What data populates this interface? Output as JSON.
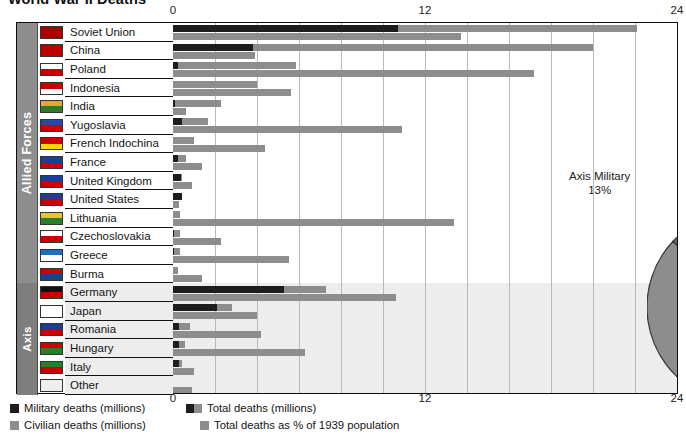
{
  "title": "World War II Deaths",
  "axis": {
    "ticks": [
      "0",
      "12",
      "24"
    ],
    "max": 24
  },
  "groups": [
    {
      "label": "Allied Forces",
      "start": 0,
      "count": 14
    },
    {
      "label": "Axis",
      "start": 14,
      "count": 6
    }
  ],
  "legend": [
    {
      "name": "military-deaths",
      "label": "Military deaths (millions)",
      "swatch": "dark"
    },
    {
      "name": "civilian-deaths",
      "label": "Civilian deaths (millions)",
      "swatch": "grey"
    },
    {
      "name": "total-deaths",
      "label": "Total deaths (millions)",
      "swatch": "split"
    },
    {
      "name": "total-deaths-pct",
      "label": "Total deaths  as % of 1939 population",
      "swatch": "grey"
    }
  ],
  "colors": {
    "military": "#1d1d1d",
    "civilian": "#8d8d8d",
    "percent": "#8d8d8d",
    "rail": "#8e8e8e",
    "axis_band": "#ededed",
    "frame": "#0e0e0e",
    "pie_allied_civilians": "#8d8d8d",
    "pie_allied_military": "#c9c9c9",
    "pie_axis_military": "#6a6a6a",
    "pie_axis_civilians": "#c4c4c4"
  },
  "chart_data": {
    "type": "bar",
    "title": "World War II Deaths",
    "xlabel": "",
    "ylabel": "",
    "xlim": [
      0,
      24
    ],
    "ticks": [
      0,
      12,
      24
    ],
    "grid": true,
    "note": "Each country row shows a stacked total-deaths bar (military in dark + civilian in grey) and a second grey bar for total deaths as % of 1939 population, both on the same 0-24 scale.",
    "series": [
      {
        "name": "Military deaths (millions)",
        "color": "#1d1d1d"
      },
      {
        "name": "Civilian deaths (millions)",
        "color": "#8d8d8d"
      },
      {
        "name": "Total deaths as % of 1939 population",
        "color": "#8d8d8d"
      }
    ],
    "categories": [
      "Soviet Union",
      "China",
      "Poland",
      "Indonesia",
      "India",
      "Yugoslavia",
      "French Indochina",
      "France",
      "United Kingdom",
      "United States",
      "Lithuania",
      "Czechoslovakia",
      "Greece",
      "Burma",
      "Latvia",
      "Germany",
      "Japan",
      "Romania",
      "Hungary",
      "Italy",
      "Other"
    ],
    "rows": [
      {
        "country": "Soviet Union",
        "side": "Allied",
        "military": 10.7,
        "civilian": 11.4,
        "total": 22.1,
        "pct": 13.7,
        "flag": "ussr"
      },
      {
        "country": "China",
        "side": "Allied",
        "military": 3.8,
        "civilian": 16.2,
        "total": 20.0,
        "pct": 3.9,
        "flag": "china"
      },
      {
        "country": "Poland",
        "side": "Allied",
        "military": 0.24,
        "civilian": 5.6,
        "total": 5.8,
        "pct": 17.2,
        "flag": "poland"
      },
      {
        "country": "Indonesia",
        "side": "Allied",
        "military": 0.0,
        "civilian": 4.0,
        "total": 4.0,
        "pct": 5.6,
        "flag": "indonesia"
      },
      {
        "country": "India",
        "side": "Allied",
        "military": 0.09,
        "civilian": 2.2,
        "total": 2.2,
        "pct": 0.6,
        "flag": "india"
      },
      {
        "country": "Yugoslavia",
        "side": "Allied",
        "military": 0.45,
        "civilian": 1.2,
        "total": 1.7,
        "pct": 10.9,
        "flag": "yugoslavia"
      },
      {
        "country": "French Indochina",
        "side": "Allied",
        "military": 0.0,
        "civilian": 1.0,
        "total": 1.0,
        "pct": 4.4,
        "flag": "indochina"
      },
      {
        "country": "France",
        "side": "Allied",
        "military": 0.22,
        "civilian": 0.39,
        "total": 0.6,
        "pct": 1.4,
        "flag": "france"
      },
      {
        "country": "United Kingdom",
        "side": "Allied",
        "military": 0.38,
        "civilian": 0.07,
        "total": 0.45,
        "pct": 0.9,
        "flag": "uk"
      },
      {
        "country": "United States",
        "side": "Allied",
        "military": 0.42,
        "civilian": 0.0,
        "total": 0.42,
        "pct": 0.3,
        "flag": "usa"
      },
      {
        "country": "Lithuania",
        "side": "Allied",
        "military": 0.0,
        "civilian": 0.35,
        "total": 0.35,
        "pct": 13.4,
        "flag": "lithuania"
      },
      {
        "country": "Czechoslovakia",
        "side": "Allied",
        "military": 0.03,
        "civilian": 0.32,
        "total": 0.34,
        "pct": 2.3,
        "flag": "czech"
      },
      {
        "country": "Greece",
        "side": "Allied",
        "military": 0.03,
        "civilian": 0.3,
        "total": 0.33,
        "pct": 5.5,
        "flag": "greece"
      },
      {
        "country": "Burma",
        "side": "Allied",
        "military": 0.0,
        "civilian": 0.25,
        "total": 0.25,
        "pct": 1.4,
        "flag": "burma"
      },
      {
        "country": "Germany",
        "side": "Axis",
        "military": 5.3,
        "civilian": 2.0,
        "total": 7.3,
        "pct": 10.6,
        "flag": "germany"
      },
      {
        "country": "Japan",
        "side": "Axis",
        "military": 2.1,
        "civilian": 0.7,
        "total": 2.8,
        "pct": 4.0,
        "flag": "japan"
      },
      {
        "country": "Romania",
        "side": "Axis",
        "military": 0.3,
        "civilian": 0.5,
        "total": 0.8,
        "pct": 4.2,
        "flag": "romania"
      },
      {
        "country": "Hungary",
        "side": "Axis",
        "military": 0.3,
        "civilian": 0.27,
        "total": 0.58,
        "pct": 6.3,
        "flag": "hungary"
      },
      {
        "country": "Italy",
        "side": "Axis",
        "military": 0.3,
        "civilian": 0.15,
        "total": 0.46,
        "pct": 1.0,
        "flag": "italy"
      },
      {
        "country": "Other",
        "side": "Axis",
        "military": 0.0,
        "civilian": 0.0,
        "total": 0.0,
        "pct": 0.9,
        "flag": "other"
      }
    ]
  },
  "pie": {
    "type": "pie",
    "slices": [
      {
        "label": "Allied Civilians",
        "value": 58,
        "value_label": "58%",
        "color": "#8d8d8d"
      },
      {
        "label": "Allied Military",
        "value": 25,
        "value_label": "25%",
        "color": "#c9c9c9"
      },
      {
        "label": "Axis Military",
        "value": 13,
        "value_label": "13%",
        "color": "#6a6a6a"
      },
      {
        "label": "Axis Civilians",
        "value": 4,
        "value_label": "4%",
        "color": "#c4c4c4"
      }
    ]
  }
}
